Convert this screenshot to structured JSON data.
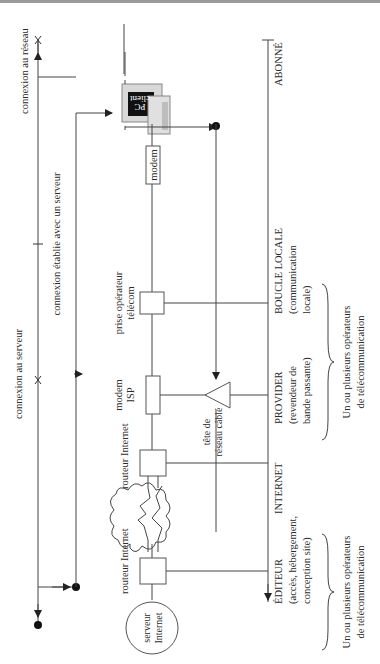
{
  "diagram": {
    "orientation": "rotated 90° counter-clockwise",
    "connections": {
      "network": "connexion au réseau",
      "server": "connexion au serveur",
      "established": "connexion établie avec un serveur"
    },
    "nodes": {
      "pc_line1": "PC",
      "pc_line2": "client",
      "modem": "modem",
      "telecom_socket_line1": "prise opérateur",
      "telecom_socket_line2": "télécom",
      "isp_modem_line1": "modem",
      "isp_modem_line2": "ISP",
      "cable_head_line1": "tête de",
      "cable_head_line2": "réseau câblé",
      "router1": "routeur Internet",
      "router2": "routeur Internet",
      "server_line1": "serveur",
      "server_line2": "Internet"
    },
    "segments": [
      {
        "title": "ABONNÉ",
        "sub1": "",
        "sub2": ""
      },
      {
        "title": "BOUCLE LOCALE",
        "sub1": "(communication",
        "sub2": "locale)"
      },
      {
        "title": "PROVIDER",
        "sub1": "(revendeur de",
        "sub2": "bande passante)"
      },
      {
        "title": "INTERNET",
        "sub1": "",
        "sub2": ""
      },
      {
        "title": "ÉDITEUR",
        "sub1": "(accès, hébergement,",
        "sub2": "conception site)"
      }
    ],
    "operators": [
      {
        "line1": "Un ou plusieurs opérateurs",
        "line2": "de télécommunication"
      },
      {
        "line1": "Un ou plusieurs opérateurs",
        "line2": "de télécommunication"
      }
    ]
  }
}
